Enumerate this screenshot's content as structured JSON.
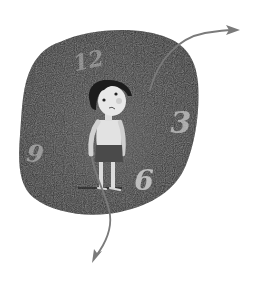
{
  "illustration": {
    "description": "Child standing inside a dark clock-face shaped blob with clock hands as arrows",
    "clock": {
      "numerals": [
        {
          "label": "12",
          "x": 90,
          "y": 68,
          "size": 22,
          "rotate": -12,
          "opacity": 0.45
        },
        {
          "label": "3",
          "x": 181,
          "y": 133,
          "size": 30,
          "rotate": 0,
          "opacity": 0.7
        },
        {
          "label": "6",
          "x": 144,
          "y": 190,
          "size": 28,
          "rotate": 0,
          "opacity": 0.85
        },
        {
          "label": "9",
          "x": 34,
          "y": 162,
          "size": 24,
          "rotate": 8,
          "opacity": 0.55
        }
      ],
      "blob_color": "#2e2e2e",
      "numeral_color": "#cfcfcf"
    },
    "hands": {
      "color": "#7a7a7a",
      "minute_hand_direction": "upper-right",
      "hour_hand_direction": "down"
    },
    "figure": {
      "subject": "child",
      "hair_color": "#1c1c1c",
      "skin_color": "#e6e6e6",
      "shorts_color": "#4a4a4a"
    }
  }
}
